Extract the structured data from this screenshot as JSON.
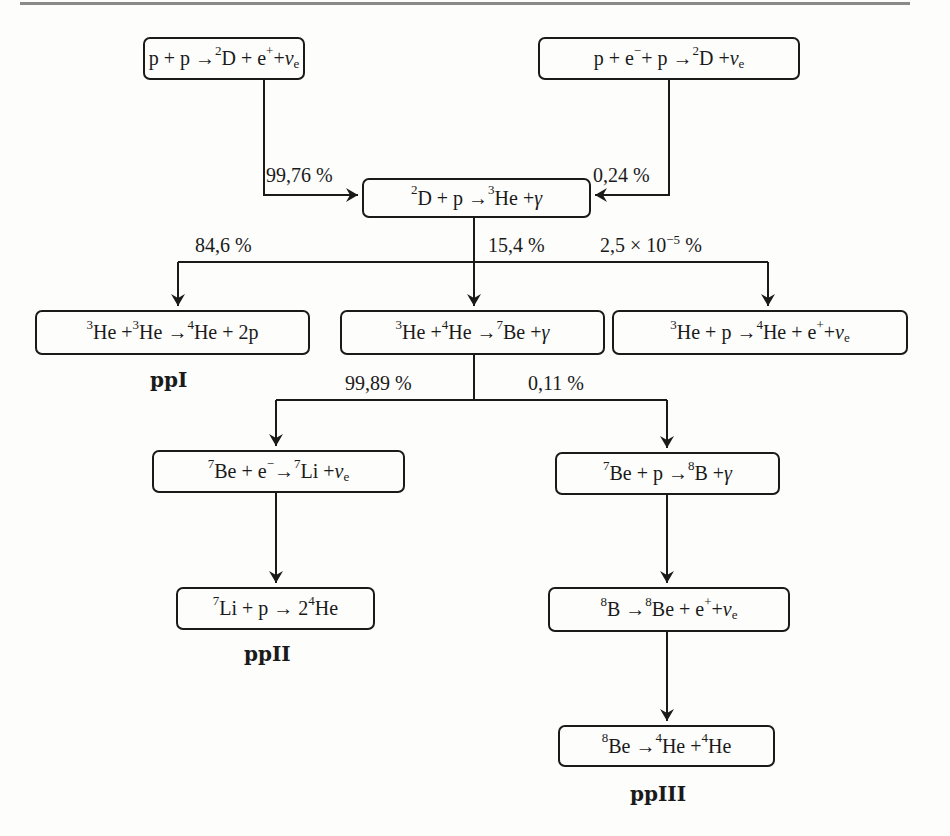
{
  "diagram": {
    "reactions": [
      {
        "id": "pp",
        "parts": [
          "p + p → ",
          "2",
          "D + e",
          "+",
          " + ",
          "ν",
          "e"
        ]
      },
      {
        "id": "pep",
        "parts": [
          "p + e",
          "−",
          " + p → ",
          "2",
          "D + ",
          "ν",
          "e"
        ]
      },
      {
        "id": "dp",
        "parts": [
          "",
          "2",
          "D + p → ",
          "3",
          "He + ",
          "γ"
        ]
      },
      {
        "id": "he3he3",
        "parts": [
          "",
          "3",
          "He + ",
          "3",
          "He → ",
          "4",
          "He + 2p"
        ]
      },
      {
        "id": "he3he4",
        "parts": [
          "",
          "3",
          "He + ",
          "4",
          "He → ",
          "7",
          "Be + ",
          "γ"
        ]
      },
      {
        "id": "hep",
        "parts": [
          "",
          "3",
          "He + p → ",
          "4",
          "He + e",
          "+",
          " + ",
          "ν",
          "e"
        ]
      },
      {
        "id": "be7e",
        "parts": [
          "",
          "7",
          "Be + e",
          "−",
          " → ",
          "7",
          "Li + ",
          "ν",
          "e"
        ]
      },
      {
        "id": "be7p",
        "parts": [
          "",
          "7",
          "Be + p → ",
          "8",
          "B + ",
          "γ"
        ]
      },
      {
        "id": "li7p",
        "parts": [
          "",
          "7",
          "Li + p → 2",
          "4",
          "He"
        ]
      },
      {
        "id": "b8",
        "parts": [
          "",
          "8",
          "B → ",
          "8",
          "Be + e",
          "+",
          " + ",
          "ν",
          "e"
        ]
      },
      {
        "id": "be8",
        "parts": [
          "",
          "8",
          "Be → ",
          "4",
          "He + ",
          "4",
          "He"
        ]
      }
    ],
    "branch_labels": {
      "pp_to_dp": "99,76 %",
      "pep_to_dp": "0,24 %",
      "dp_to_he3he3": "84,6 %",
      "dp_to_he3he4": "15,4 %",
      "dp_to_hep_base": "2,5 × 10",
      "dp_to_hep_exp": "−5",
      "dp_to_hep_unit": " %",
      "he3he4_to_be7e": "99,89 %",
      "he3he4_to_be7p": "0,11 %"
    },
    "chains": {
      "ppI": "ppI",
      "ppII": "ppII",
      "ppIII": "ppIII"
    },
    "colors": {
      "ink": "#1a1a1a",
      "paper": "#fdfdfc",
      "rule": "#8a8a8a"
    }
  }
}
